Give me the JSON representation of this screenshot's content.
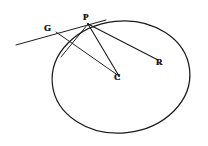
{
  "figure": {
    "kind": "geometry-diagram",
    "background_color": "#ffffff",
    "ink_color": "#1a1a1a",
    "canvas": {
      "width": 208,
      "height": 146
    },
    "labels": [
      {
        "id": "P",
        "text": "P",
        "x": 88,
        "y": 24,
        "role": "point-of-tangency"
      },
      {
        "id": "G",
        "text": "G",
        "x": 58,
        "y": 34,
        "role": "point-on-tangent"
      },
      {
        "id": "C",
        "text": "C",
        "x": 118,
        "y": 79,
        "role": "circle-centre"
      },
      {
        "id": "R",
        "text": "R",
        "x": 160,
        "y": 63,
        "role": "interior-point"
      }
    ],
    "shapes": {
      "circle": {
        "name": "main-circle",
        "center_x": 121,
        "center_y": 77,
        "radius_x": 69,
        "radius_y": 56,
        "rotation_deg": -6,
        "stroke_width": 1.25
      },
      "segments": [
        {
          "id": "tangent-line",
          "from": [
            16,
            45
          ],
          "to": [
            106,
            20
          ],
          "stroke_width": 1.0,
          "label": "tangent through G and P"
        },
        {
          "id": "segment-P-C",
          "from": [
            88,
            24
          ],
          "to": [
            119,
            76
          ],
          "stroke_width": 1.1,
          "label": "radius P to C"
        },
        {
          "id": "segment-P-R",
          "from": [
            88,
            24
          ],
          "to": [
            158,
            60
          ],
          "stroke_width": 1.1,
          "label": "P to R"
        },
        {
          "id": "segment-G-C",
          "from": [
            56,
            32
          ],
          "to": [
            119,
            76
          ],
          "stroke_width": 0.95,
          "label": "G to C"
        },
        {
          "id": "chord-P-lower-left",
          "from": [
            88,
            24
          ],
          "to": [
            61,
            57
          ],
          "stroke_width": 0.95,
          "label": "chord from P descending left"
        }
      ]
    }
  }
}
